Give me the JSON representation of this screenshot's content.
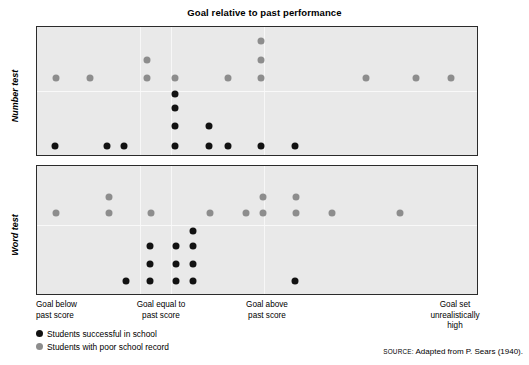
{
  "title": "Goal relative to past performance",
  "panels": [
    {
      "id": "number",
      "label": "Number test"
    },
    {
      "id": "word",
      "label": "Word test"
    }
  ],
  "x_labels": [
    {
      "id": "goal-below",
      "text": "Goal below\npast score"
    },
    {
      "id": "goal-equal",
      "text": "Goal equal to\npast score"
    },
    {
      "id": "goal-above",
      "text": "Goal above\npast score"
    },
    {
      "id": "goal-unrealistic",
      "text": "Goal set\nunrealistically\nhigh"
    }
  ],
  "legend": [
    {
      "id": "successful",
      "color": "#121212",
      "label": "Students successful in school"
    },
    {
      "id": "poor-record",
      "color": "#8d8d8d",
      "label": "Students with poor school record"
    }
  ],
  "source": {
    "kicker": "SOURCE:",
    "text": "Adapted from P. Sears (1940)."
  },
  "colors": {
    "panel_background": "#e9e9e9",
    "panel_border": "#2b2b2b",
    "successful": "#121212",
    "poor_record": "#8d8d8d",
    "page_background": "#ffffff"
  },
  "chart_data": {
    "type": "scatter",
    "title": "Goal relative to past performance",
    "xlabel": "Goal relative to past performance",
    "ylabel": "",
    "grid": true,
    "legend_position": "bottom-left",
    "axis_note": "x in panel pixel fraction 0-1 left-to-right across the plotting band; y in panel pixel fraction 0-1 top-to-bottom",
    "categories": [
      "Goal below past score",
      "Goal equal to past score",
      "Goal above past score",
      "Goal set unrealistically high"
    ],
    "category_x": [
      0.04,
      0.31,
      0.52,
      0.86
    ],
    "series": [
      {
        "name": "Students successful in school",
        "color": "#121212",
        "panels": [
          {
            "panel": "Number test",
            "count": 11,
            "points": [
              {
                "x": 0.041,
                "y": 0.93
              },
              {
                "x": 0.159,
                "y": 0.93
              },
              {
                "x": 0.197,
                "y": 0.93
              },
              {
                "x": 0.313,
                "y": 0.52
              },
              {
                "x": 0.313,
                "y": 0.63
              },
              {
                "x": 0.313,
                "y": 0.77
              },
              {
                "x": 0.313,
                "y": 0.93
              },
              {
                "x": 0.392,
                "y": 0.77
              },
              {
                "x": 0.392,
                "y": 0.93
              },
              {
                "x": 0.433,
                "y": 0.93
              },
              {
                "x": 0.51,
                "y": 0.93
              },
              {
                "x": 0.587,
                "y": 0.93
              }
            ]
          },
          {
            "panel": "Word test",
            "count": 11,
            "points": [
              {
                "x": 0.203,
                "y": 0.9
              },
              {
                "x": 0.256,
                "y": 0.625
              },
              {
                "x": 0.256,
                "y": 0.762
              },
              {
                "x": 0.256,
                "y": 0.9
              },
              {
                "x": 0.317,
                "y": 0.625
              },
              {
                "x": 0.317,
                "y": 0.762
              },
              {
                "x": 0.317,
                "y": 0.9
              },
              {
                "x": 0.355,
                "y": 0.51
              },
              {
                "x": 0.355,
                "y": 0.625
              },
              {
                "x": 0.355,
                "y": 0.762
              },
              {
                "x": 0.355,
                "y": 0.9
              },
              {
                "x": 0.587,
                "y": 0.9
              }
            ]
          }
        ]
      },
      {
        "name": "Students with poor school record",
        "color": "#8d8d8d",
        "panels": [
          {
            "panel": "Number test",
            "count": 13,
            "points": [
              {
                "x": 0.043,
                "y": 0.4
              },
              {
                "x": 0.12,
                "y": 0.4
              },
              {
                "x": 0.251,
                "y": 0.255
              },
              {
                "x": 0.251,
                "y": 0.4
              },
              {
                "x": 0.313,
                "y": 0.4
              },
              {
                "x": 0.434,
                "y": 0.4
              },
              {
                "x": 0.509,
                "y": 0.11
              },
              {
                "x": 0.509,
                "y": 0.255
              },
              {
                "x": 0.509,
                "y": 0.4
              },
              {
                "x": 0.747,
                "y": 0.4
              },
              {
                "x": 0.862,
                "y": 0.4
              },
              {
                "x": 0.941,
                "y": 0.4
              }
            ]
          },
          {
            "panel": "Word test",
            "count": 12,
            "points": [
              {
                "x": 0.043,
                "y": 0.37
              },
              {
                "x": 0.163,
                "y": 0.24
              },
              {
                "x": 0.163,
                "y": 0.37
              },
              {
                "x": 0.258,
                "y": 0.37
              },
              {
                "x": 0.394,
                "y": 0.37
              },
              {
                "x": 0.475,
                "y": 0.37
              },
              {
                "x": 0.513,
                "y": 0.24
              },
              {
                "x": 0.513,
                "y": 0.37
              },
              {
                "x": 0.589,
                "y": 0.24
              },
              {
                "x": 0.589,
                "y": 0.37
              },
              {
                "x": 0.67,
                "y": 0.37
              },
              {
                "x": 0.824,
                "y": 0.37
              }
            ]
          }
        ]
      }
    ]
  }
}
